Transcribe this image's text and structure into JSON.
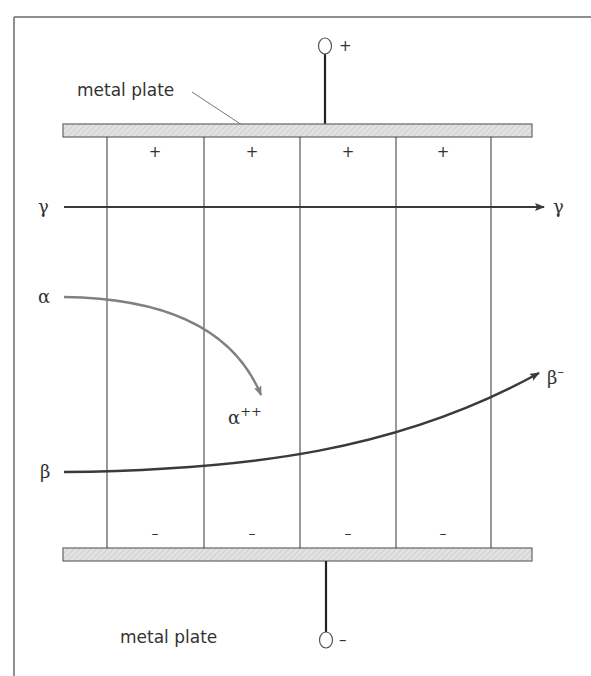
{
  "figure": {
    "frame": {
      "left": 14,
      "top": 17,
      "right_open": true,
      "bottom_open": true
    },
    "colors": {
      "frame": "#6a6a6a",
      "plate_fill": "#dcdcdc",
      "plate_stroke": "#555555",
      "line": "#333333",
      "alpha_path": "#808080",
      "beta_path": "#3a3a3a",
      "gamma_path": "#3a3a3a",
      "text": "#333333"
    },
    "top_plate": {
      "label": "metal plate",
      "terminal_sign": "+",
      "charge_signs": [
        "+",
        "+",
        "+",
        "+"
      ]
    },
    "bottom_plate": {
      "label": "metal plate",
      "terminal_sign": "–",
      "charge_signs": [
        "–",
        "–",
        "–",
        "–"
      ]
    },
    "rays": {
      "gamma": {
        "start_label": "γ",
        "end_label": "γ"
      },
      "alpha": {
        "start_label": "α",
        "end_label": "α",
        "end_superscript": "++"
      },
      "beta": {
        "start_label": "β",
        "end_label": "β",
        "end_superscript": "–"
      }
    }
  }
}
